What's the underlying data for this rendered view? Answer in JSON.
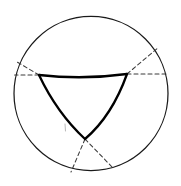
{
  "figure": {
    "title": "Curvilinear triangle inscribed in a circle",
    "kind": "geometric-construction-diagram",
    "background_color": "#ffffff",
    "canvas": {
      "width": 181,
      "height": 186
    },
    "colors": {
      "circle_stroke": "#1a1a1a",
      "triangle_stroke": "#000000",
      "dashed_stroke": "#3a3a3a",
      "faint_mark": "#b9b9b9"
    },
    "circle": {
      "name": "outer-circle",
      "center_x": 91,
      "center_y": 93.5,
      "radius": 77,
      "stroke_width": 1.25,
      "style": "solid"
    },
    "triangle": {
      "name": "curvilinear-triangle",
      "orientation": "point-down",
      "side_style": "concave-arc",
      "stroke_width": 2.3,
      "vertices": [
        {
          "label": "left-vertex",
          "x": 39,
          "y": 75
        },
        {
          "label": "right-vertex",
          "x": 127,
          "y": 74
        },
        {
          "label": "bottom-vertex",
          "x": 85,
          "y": 139
        }
      ],
      "arcs": [
        {
          "label": "top-arc",
          "from": "left-vertex",
          "to": "right-vertex",
          "control_x": 83,
          "control_y": 80
        },
        {
          "label": "right-arc",
          "from": "right-vertex",
          "to": "bottom-vertex",
          "control_x": 112,
          "control_y": 116
        },
        {
          "label": "left-arc",
          "from": "bottom-vertex",
          "to": "left-vertex",
          "control_x": 57,
          "control_y": 113
        }
      ]
    },
    "dashed_rays": [
      {
        "label": "left-upper-ray",
        "x1": 39,
        "y1": 75,
        "x2": 15.5,
        "y2": 61
      },
      {
        "label": "left-lower-ray",
        "x1": 39,
        "y1": 75,
        "x2": 14.6,
        "y2": 75
      },
      {
        "label": "right-upper-ray",
        "x1": 127,
        "y1": 74,
        "x2": 159,
        "y2": 47
      },
      {
        "label": "right-lower-ray",
        "x1": 127,
        "y1": 74,
        "x2": 167.5,
        "y2": 74
      },
      {
        "label": "bottom-left-ray",
        "x1": 85,
        "y1": 139,
        "x2": 71,
        "y2": 172
      },
      {
        "label": "bottom-right-ray",
        "x1": 85,
        "y1": 139,
        "x2": 113,
        "y2": 168
      }
    ],
    "faint_marks": [
      {
        "label": "faint-tick",
        "x1": 65,
        "y1": 124,
        "x2": 65.5,
        "y2": 131
      }
    ]
  }
}
